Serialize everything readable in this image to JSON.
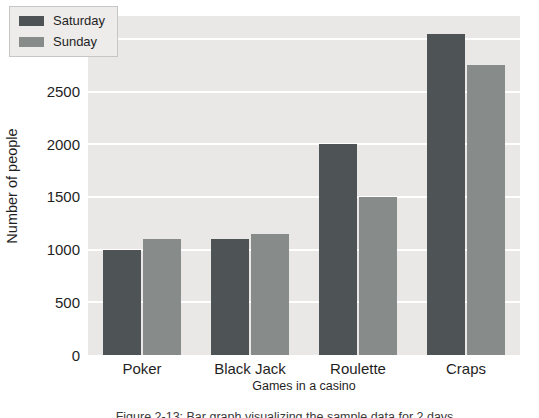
{
  "chart_data": {
    "type": "bar",
    "title": "",
    "categories": [
      "Poker",
      "Black Jack",
      "Roulette",
      "Craps"
    ],
    "series": [
      {
        "name": "Saturday",
        "color": "#4e5456",
        "values": [
          1000,
          1100,
          2000,
          3050
        ]
      },
      {
        "name": "Sunday",
        "color": "#878b8a",
        "values": [
          1100,
          1150,
          1500,
          2750
        ]
      }
    ],
    "xlabel": "Games in a casino",
    "ylabel": "Number of people",
    "ylim": [
      0,
      3218
    ],
    "yticks": [
      0,
      500,
      1000,
      1500,
      2000,
      2500,
      3000
    ],
    "grid": "horizontal white gridlines on light gray panel",
    "legend_position": "upper-left"
  },
  "axes": {
    "ylabel": "Number of people",
    "xlabel": "Games in a casino",
    "ytick_labels": [
      "0",
      "500",
      "1000",
      "1500",
      "2000",
      "2500",
      "3000"
    ],
    "xtick_labels": [
      "Poker",
      "Black Jack",
      "Roulette",
      "Craps"
    ]
  },
  "legend": {
    "items": [
      {
        "label": "Saturday",
        "color": "#4e5456"
      },
      {
        "label": "Sunday",
        "color": "#878b8a"
      }
    ]
  },
  "caption": {
    "fragment": "Figure 2-13: Bar graph visualizing the sample data for 2 days"
  },
  "colors": {
    "panel_bg": "#e9e8e6",
    "gridline": "#ffffff",
    "saturday_bar": "#4e5456",
    "sunday_bar": "#878b8a",
    "legend_bg": "#edecea",
    "legend_border": "#c6c6c4",
    "text": "#1f1f1f"
  }
}
